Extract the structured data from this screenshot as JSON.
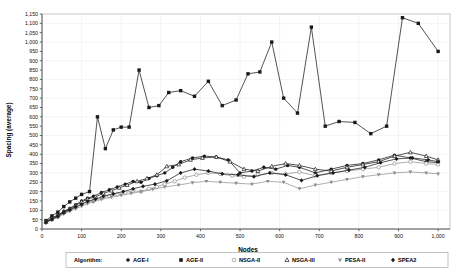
{
  "chart_data": {
    "type": "line",
    "title": "",
    "xlabel": "Nodes",
    "ylabel": "Spacing (average)",
    "xlim": [
      0,
      1030
    ],
    "ylim": [
      0,
      1150
    ],
    "grid": true,
    "legend_position": "bottom",
    "legend_title": "Algorithm:",
    "xticks": [
      0,
      100,
      200,
      300,
      400,
      500,
      600,
      700,
      800,
      900,
      1000
    ],
    "xtick_labels": [
      "0",
      "100",
      "200",
      "300",
      "400",
      "500",
      "600",
      "700",
      "800",
      "900",
      "1,000"
    ],
    "yticks": [
      0,
      50,
      100,
      150,
      200,
      250,
      300,
      350,
      400,
      450,
      500,
      550,
      600,
      650,
      700,
      750,
      800,
      850,
      900,
      950,
      1000,
      1050,
      1100,
      1150
    ],
    "ytick_labels": [
      "0",
      "50",
      "100",
      "150",
      "200",
      "250",
      "300",
      "350",
      "400",
      "450",
      "500",
      "550",
      "600",
      "650",
      "700",
      "750",
      "800",
      "850",
      "900",
      "950",
      "1,000",
      "1,050",
      "1,100",
      "1,150"
    ],
    "series": [
      {
        "name": "AGE-I",
        "marker": "circle",
        "color": "#1a1a1a",
        "x": [
          10,
          25,
          40,
          55,
          70,
          85,
          100,
          115,
          130,
          150,
          170,
          190,
          210,
          230,
          250,
          270,
          290,
          310,
          330,
          350,
          380,
          410,
          440,
          470,
          500,
          530,
          560,
          590,
          620,
          650,
          690,
          730,
          770,
          810,
          850,
          890,
          930,
          970,
          1000
        ],
        "y": [
          40,
          60,
          75,
          95,
          110,
          130,
          150,
          165,
          175,
          195,
          210,
          225,
          240,
          255,
          250,
          270,
          285,
          300,
          330,
          360,
          380,
          390,
          385,
          370,
          300,
          310,
          330,
          320,
          340,
          330,
          300,
          320,
          340,
          350,
          370,
          395,
          380,
          360,
          355
        ]
      },
      {
        "name": "AGE-II",
        "marker": "square",
        "color": "#1a1a1a",
        "x": [
          10,
          25,
          40,
          55,
          70,
          85,
          100,
          120,
          140,
          160,
          180,
          200,
          220,
          245,
          270,
          295,
          320,
          350,
          385,
          420,
          455,
          490,
          520,
          550,
          580,
          610,
          645,
          680,
          715,
          750,
          790,
          830,
          870,
          910,
          950,
          1000
        ],
        "y": [
          45,
          70,
          90,
          120,
          145,
          165,
          185,
          200,
          600,
          430,
          530,
          545,
          545,
          850,
          650,
          660,
          730,
          740,
          710,
          790,
          660,
          690,
          830,
          840,
          1000,
          700,
          620,
          1080,
          550,
          575,
          570,
          510,
          550,
          1130,
          1100,
          950
        ]
      },
      {
        "name": "NSGA-II",
        "marker": "circle-open",
        "color": "#8d8d8d",
        "x": [
          10,
          25,
          40,
          55,
          70,
          85,
          100,
          115,
          130,
          150,
          170,
          190,
          210,
          230,
          250,
          270,
          290,
          310,
          335,
          360,
          390,
          420,
          450,
          480,
          510,
          545,
          580,
          615,
          650,
          690,
          730,
          770,
          810,
          850,
          890,
          930,
          970,
          1000
        ],
        "y": [
          35,
          50,
          65,
          85,
          100,
          115,
          130,
          145,
          150,
          165,
          175,
          185,
          195,
          205,
          200,
          215,
          225,
          240,
          255,
          275,
          290,
          300,
          295,
          285,
          280,
          290,
          300,
          295,
          305,
          285,
          300,
          310,
          320,
          330,
          350,
          360,
          350,
          345
        ]
      },
      {
        "name": "NSGA-III",
        "marker": "triangle",
        "color": "#1a1a1a",
        "x": [
          10,
          25,
          40,
          55,
          70,
          85,
          100,
          115,
          135,
          155,
          175,
          195,
          215,
          240,
          265,
          290,
          315,
          345,
          375,
          405,
          440,
          475,
          510,
          545,
          580,
          615,
          650,
          690,
          730,
          770,
          810,
          850,
          890,
          930,
          970,
          1000
        ],
        "y": [
          38,
          55,
          72,
          92,
          108,
          125,
          145,
          160,
          172,
          190,
          205,
          220,
          235,
          255,
          270,
          290,
          335,
          345,
          370,
          380,
          385,
          360,
          320,
          310,
          335,
          350,
          340,
          320,
          310,
          330,
          345,
          360,
          390,
          410,
          390,
          370
        ]
      },
      {
        "name": "PESA-II",
        "marker": "triangle-down",
        "color": "#8d8d8d",
        "x": [
          10,
          25,
          40,
          55,
          70,
          85,
          100,
          115,
          130,
          150,
          175,
          200,
          225,
          250,
          280,
          310,
          345,
          380,
          415,
          450,
          490,
          530,
          570,
          610,
          650,
          690,
          730,
          770,
          810,
          850,
          890,
          930,
          970,
          1000
        ],
        "y": [
          32,
          48,
          62,
          80,
          95,
          108,
          122,
          135,
          145,
          158,
          170,
          180,
          190,
          200,
          212,
          225,
          235,
          248,
          255,
          250,
          245,
          240,
          255,
          250,
          215,
          235,
          250,
          265,
          280,
          290,
          300,
          305,
          300,
          295
        ]
      },
      {
        "name": "SPEA2",
        "marker": "diamond",
        "color": "#1a1a1a",
        "x": [
          10,
          25,
          40,
          55,
          70,
          85,
          100,
          115,
          135,
          155,
          180,
          205,
          230,
          255,
          285,
          315,
          350,
          385,
          420,
          455,
          495,
          535,
          575,
          615,
          655,
          695,
          735,
          775,
          815,
          855,
          895,
          935,
          975,
          1000
        ],
        "y": [
          36,
          52,
          68,
          88,
          102,
          118,
          132,
          148,
          160,
          175,
          188,
          200,
          215,
          228,
          240,
          258,
          300,
          320,
          310,
          295,
          290,
          280,
          300,
          290,
          260,
          285,
          300,
          315,
          330,
          355,
          375,
          380,
          370,
          360
        ]
      }
    ]
  }
}
